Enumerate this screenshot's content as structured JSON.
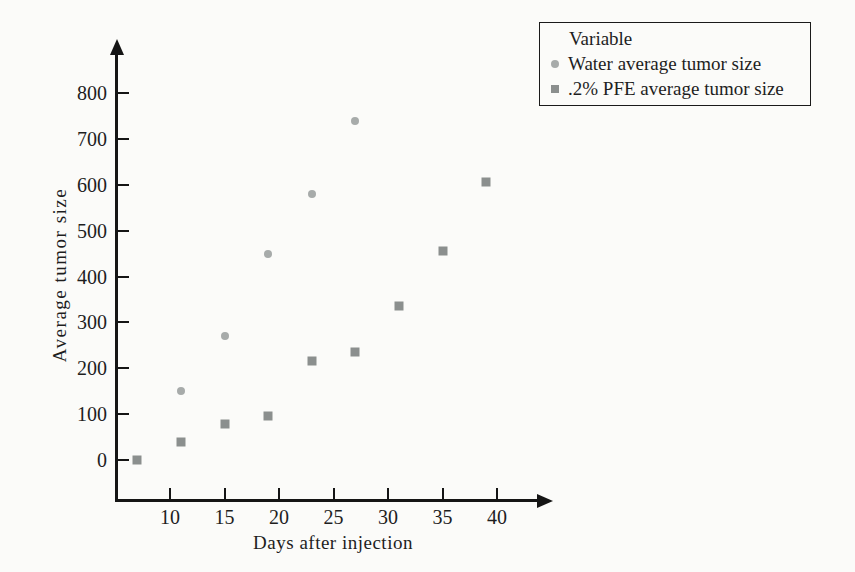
{
  "chart_data": {
    "type": "scatter",
    "title": "",
    "legend_title": "Variable",
    "xlabel": "Days after injection",
    "ylabel": "Average tumor size",
    "xticks": [
      10,
      15,
      20,
      25,
      30,
      35,
      40
    ],
    "yticks": [
      0,
      100,
      200,
      300,
      400,
      500,
      600,
      700,
      800
    ],
    "xlim": [
      5,
      43
    ],
    "ylim": [
      0,
      870
    ],
    "grid": false,
    "legend_position": "top-right",
    "axis_color": "#151515",
    "series": [
      {
        "name": "Water average tumor size",
        "marker": "circle",
        "color": "#a7abaa",
        "x": [
          11,
          15,
          19,
          23,
          27
        ],
        "y": [
          150,
          270,
          450,
          580,
          740
        ]
      },
      {
        "name": ".2% PFE average tumor size",
        "marker": "square",
        "color": "#8b8f8e",
        "x": [
          7,
          11,
          15,
          19,
          23,
          27,
          31,
          35,
          39
        ],
        "y": [
          0,
          40,
          78,
          95,
          215,
          235,
          335,
          455,
          605
        ]
      }
    ]
  }
}
